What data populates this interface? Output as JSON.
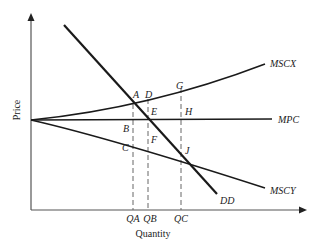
{
  "axes": {
    "x_label": "Quantity",
    "y_label": "Price"
  },
  "curves": {
    "mscx": "MSCX",
    "mpc": "MPC",
    "mscy": "MSCY",
    "dd": "DD"
  },
  "points": {
    "a": "A",
    "b": "B",
    "c": "C",
    "d": "D",
    "e": "E",
    "f": "F",
    "g": "G",
    "h": "H",
    "j": "J"
  },
  "quantities": {
    "qa": "QA",
    "qb": "QB",
    "qc": "QC"
  },
  "colors": {
    "line": "#1a1a1a",
    "axis": "#555555",
    "dash": "#666666"
  }
}
